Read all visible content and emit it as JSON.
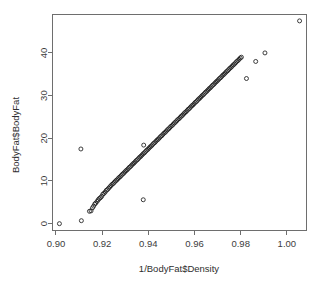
{
  "chart_data": {
    "type": "scatter",
    "title": "",
    "xlabel": "1/BodyFat$Density",
    "ylabel": "BodyFat$BodyFat",
    "xlim": [
      0.8985,
      1.0085
    ],
    "ylim": [
      -1.6,
      49.0
    ],
    "grid": false,
    "legend": null,
    "marker": "open-circle",
    "xticks": [
      "0.90",
      "0.92",
      "0.94",
      "0.96",
      "0.98",
      "1.00"
    ],
    "xtick_values": [
      0.9,
      0.92,
      0.94,
      0.96,
      0.98,
      1.0
    ],
    "yticks": [
      "0",
      "10",
      "20",
      "30",
      "40"
    ],
    "ytick_values": [
      0,
      10,
      20,
      30,
      40
    ],
    "outliers": [
      {
        "x": 0.9015,
        "y": 0.0
      },
      {
        "x": 0.911,
        "y": 0.7
      },
      {
        "x": 0.9108,
        "y": 17.5
      },
      {
        "x": 0.938,
        "y": 18.4
      },
      {
        "x": 0.9378,
        "y": 5.6
      },
      {
        "x": 0.9825,
        "y": 34.0
      },
      {
        "x": 0.9865,
        "y": 38.0
      },
      {
        "x": 0.9905,
        "y": 40.0
      },
      {
        "x": 1.0055,
        "y": 47.5
      }
    ],
    "points": [
      {
        "x": 0.9015,
        "y": 0.0
      },
      {
        "x": 0.911,
        "y": 0.7
      },
      {
        "x": 0.9108,
        "y": 17.5
      },
      {
        "x": 0.9145,
        "y": 2.9
      },
      {
        "x": 0.9152,
        "y": 3.0
      },
      {
        "x": 0.9158,
        "y": 3.7
      },
      {
        "x": 0.9163,
        "y": 4.1
      },
      {
        "x": 0.9168,
        "y": 4.6
      },
      {
        "x": 0.9172,
        "y": 4.8
      },
      {
        "x": 0.9178,
        "y": 5.2
      },
      {
        "x": 0.9183,
        "y": 5.6
      },
      {
        "x": 0.9188,
        "y": 5.9
      },
      {
        "x": 0.9193,
        "y": 6.1
      },
      {
        "x": 0.9198,
        "y": 6.4
      },
      {
        "x": 0.9203,
        "y": 6.9
      },
      {
        "x": 0.9208,
        "y": 7.1
      },
      {
        "x": 0.9213,
        "y": 7.4
      },
      {
        "x": 0.9218,
        "y": 7.8
      },
      {
        "x": 0.9223,
        "y": 8.0
      },
      {
        "x": 0.9228,
        "y": 8.3
      },
      {
        "x": 0.9233,
        "y": 8.6
      },
      {
        "x": 0.9238,
        "y": 8.9
      },
      {
        "x": 0.9243,
        "y": 9.2
      },
      {
        "x": 0.9248,
        "y": 9.4
      },
      {
        "x": 0.9253,
        "y": 9.7
      },
      {
        "x": 0.9258,
        "y": 10.0
      },
      {
        "x": 0.9263,
        "y": 10.2
      },
      {
        "x": 0.9268,
        "y": 10.5
      },
      {
        "x": 0.9273,
        "y": 10.8
      },
      {
        "x": 0.9278,
        "y": 11.0
      },
      {
        "x": 0.9283,
        "y": 11.3
      },
      {
        "x": 0.9288,
        "y": 11.6
      },
      {
        "x": 0.9293,
        "y": 11.8
      },
      {
        "x": 0.9298,
        "y": 12.1
      },
      {
        "x": 0.9303,
        "y": 12.4
      },
      {
        "x": 0.9308,
        "y": 12.6
      },
      {
        "x": 0.9313,
        "y": 12.9
      },
      {
        "x": 0.9318,
        "y": 13.2
      },
      {
        "x": 0.9323,
        "y": 13.4
      },
      {
        "x": 0.9328,
        "y": 13.7
      },
      {
        "x": 0.9333,
        "y": 14.0
      },
      {
        "x": 0.9338,
        "y": 14.2
      },
      {
        "x": 0.9343,
        "y": 14.5
      },
      {
        "x": 0.9348,
        "y": 14.8
      },
      {
        "x": 0.9353,
        "y": 15.0
      },
      {
        "x": 0.9358,
        "y": 15.3
      },
      {
        "x": 0.9363,
        "y": 15.6
      },
      {
        "x": 0.9368,
        "y": 15.8
      },
      {
        "x": 0.9373,
        "y": 16.1
      },
      {
        "x": 0.9378,
        "y": 16.4
      },
      {
        "x": 0.938,
        "y": 18.4
      },
      {
        "x": 0.9378,
        "y": 5.6
      },
      {
        "x": 0.9383,
        "y": 16.6
      },
      {
        "x": 0.9388,
        "y": 16.9
      },
      {
        "x": 0.9393,
        "y": 17.2
      },
      {
        "x": 0.9398,
        "y": 17.4
      },
      {
        "x": 0.9403,
        "y": 17.7
      },
      {
        "x": 0.9408,
        "y": 18.0
      },
      {
        "x": 0.9413,
        "y": 18.2
      },
      {
        "x": 0.9418,
        "y": 18.5
      },
      {
        "x": 0.9423,
        "y": 18.8
      },
      {
        "x": 0.9428,
        "y": 19.0
      },
      {
        "x": 0.9433,
        "y": 19.3
      },
      {
        "x": 0.9438,
        "y": 19.6
      },
      {
        "x": 0.9443,
        "y": 19.8
      },
      {
        "x": 0.9448,
        "y": 20.1
      },
      {
        "x": 0.9453,
        "y": 20.4
      },
      {
        "x": 0.9458,
        "y": 20.6
      },
      {
        "x": 0.9463,
        "y": 20.9
      },
      {
        "x": 0.9468,
        "y": 21.2
      },
      {
        "x": 0.9473,
        "y": 21.4
      },
      {
        "x": 0.9478,
        "y": 21.7
      },
      {
        "x": 0.9483,
        "y": 22.0
      },
      {
        "x": 0.9488,
        "y": 22.2
      },
      {
        "x": 0.9493,
        "y": 22.5
      },
      {
        "x": 0.9498,
        "y": 22.8
      },
      {
        "x": 0.9503,
        "y": 23.0
      },
      {
        "x": 0.9508,
        "y": 23.3
      },
      {
        "x": 0.9513,
        "y": 23.6
      },
      {
        "x": 0.9518,
        "y": 23.8
      },
      {
        "x": 0.9523,
        "y": 24.1
      },
      {
        "x": 0.9528,
        "y": 24.4
      },
      {
        "x": 0.9533,
        "y": 24.6
      },
      {
        "x": 0.9538,
        "y": 24.9
      },
      {
        "x": 0.9543,
        "y": 25.2
      },
      {
        "x": 0.9548,
        "y": 25.4
      },
      {
        "x": 0.9553,
        "y": 25.7
      },
      {
        "x": 0.9558,
        "y": 26.0
      },
      {
        "x": 0.9563,
        "y": 26.2
      },
      {
        "x": 0.9568,
        "y": 26.5
      },
      {
        "x": 0.9573,
        "y": 26.8
      },
      {
        "x": 0.9578,
        "y": 27.0
      },
      {
        "x": 0.9583,
        "y": 27.3
      },
      {
        "x": 0.9588,
        "y": 27.6
      },
      {
        "x": 0.9593,
        "y": 27.8
      },
      {
        "x": 0.9598,
        "y": 28.1
      },
      {
        "x": 0.9603,
        "y": 28.4
      },
      {
        "x": 0.9608,
        "y": 28.6
      },
      {
        "x": 0.9613,
        "y": 28.9
      },
      {
        "x": 0.9618,
        "y": 29.2
      },
      {
        "x": 0.9623,
        "y": 29.4
      },
      {
        "x": 0.9628,
        "y": 29.7
      },
      {
        "x": 0.9633,
        "y": 30.0
      },
      {
        "x": 0.9638,
        "y": 30.2
      },
      {
        "x": 0.9643,
        "y": 30.5
      },
      {
        "x": 0.9648,
        "y": 30.8
      },
      {
        "x": 0.9653,
        "y": 31.0
      },
      {
        "x": 0.9658,
        "y": 31.3
      },
      {
        "x": 0.9663,
        "y": 31.6
      },
      {
        "x": 0.9668,
        "y": 31.8
      },
      {
        "x": 0.9673,
        "y": 32.1
      },
      {
        "x": 0.9678,
        "y": 32.4
      },
      {
        "x": 0.9683,
        "y": 32.6
      },
      {
        "x": 0.9688,
        "y": 32.9
      },
      {
        "x": 0.9693,
        "y": 33.2
      },
      {
        "x": 0.9698,
        "y": 33.4
      },
      {
        "x": 0.9703,
        "y": 33.7
      },
      {
        "x": 0.9708,
        "y": 34.0
      },
      {
        "x": 0.9713,
        "y": 34.2
      },
      {
        "x": 0.9718,
        "y": 34.5
      },
      {
        "x": 0.9723,
        "y": 34.8
      },
      {
        "x": 0.9728,
        "y": 35.0
      },
      {
        "x": 0.9733,
        "y": 35.3
      },
      {
        "x": 0.9738,
        "y": 35.6
      },
      {
        "x": 0.9743,
        "y": 35.8
      },
      {
        "x": 0.9748,
        "y": 36.1
      },
      {
        "x": 0.9753,
        "y": 36.4
      },
      {
        "x": 0.9758,
        "y": 36.6
      },
      {
        "x": 0.9763,
        "y": 36.9
      },
      {
        "x": 0.9768,
        "y": 37.2
      },
      {
        "x": 0.9773,
        "y": 37.4
      },
      {
        "x": 0.9778,
        "y": 37.7
      },
      {
        "x": 0.9783,
        "y": 38.0
      },
      {
        "x": 0.9788,
        "y": 38.2
      },
      {
        "x": 0.9793,
        "y": 38.5
      },
      {
        "x": 0.9798,
        "y": 38.8
      },
      {
        "x": 0.9803,
        "y": 39.0
      },
      {
        "x": 0.9825,
        "y": 34.0
      },
      {
        "x": 0.9865,
        "y": 38.0
      },
      {
        "x": 0.9905,
        "y": 40.0
      },
      {
        "x": 1.0055,
        "y": 47.5
      }
    ]
  }
}
